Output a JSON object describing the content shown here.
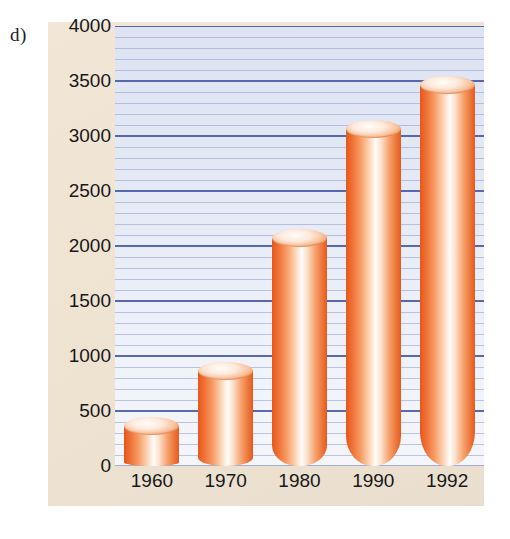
{
  "figure": {
    "panel_label": "d)",
    "background_color": "#ffffff",
    "panel_color": "#efe3d2",
    "plot_color": "#e4e9f5"
  },
  "chart_data": {
    "type": "bar",
    "title": "",
    "subtitle": "",
    "xlabel": "",
    "ylabel": "",
    "categories": [
      "1960",
      "1970",
      "1980",
      "1990",
      "1992"
    ],
    "values": [
      360,
      860,
      2070,
      3060,
      3460
    ],
    "series": [
      {
        "name": "",
        "values": [
          360,
          860,
          2070,
          3060,
          3460
        ]
      }
    ],
    "ylim": [
      0,
      4000
    ],
    "xlim": [
      0,
      5
    ],
    "y_major_ticks": [
      0,
      500,
      1000,
      1500,
      2000,
      2500,
      3000,
      3500,
      4000
    ],
    "y_major_tick_labels": [
      "0",
      "500",
      "1000",
      "1500",
      "2000",
      "2500",
      "3000",
      "3500",
      "4000"
    ],
    "y_minor_tick_step": 100,
    "grid": true,
    "grid_orientation": "horizontal",
    "grid_major_color": "#4a5ca8",
    "grid_minor_color": "#97a5cf",
    "legend": false,
    "legend_position": "none",
    "bar_style": "3d-cylinder",
    "bar_color": "#ef7337",
    "bar_highlight_color": "#fffdfb",
    "bar_edge_color": "#e45a1e",
    "annotations": []
  }
}
